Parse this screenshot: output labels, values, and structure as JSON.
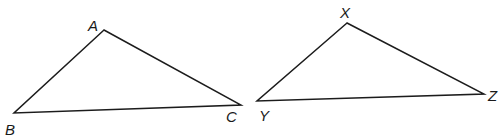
{
  "figure": {
    "background_color": "#ffffff",
    "stroke_color": "#1c1c1c",
    "label_color": "#1a1a1a",
    "stroke_width": 1.5,
    "width": 503,
    "height": 138
  },
  "shapes": [
    {
      "name": "triangle-abc",
      "vertices": [
        {
          "label": "A",
          "x": 104,
          "y": 30,
          "label_x": 88,
          "label_y": 31
        },
        {
          "label": "B",
          "x": 14,
          "y": 113,
          "label_x": 5,
          "label_y": 135
        },
        {
          "label": "C",
          "x": 241,
          "y": 105,
          "label_x": 226,
          "label_y": 122
        }
      ],
      "path": "M 104 30 L 14 113 L 241 105 Z"
    },
    {
      "name": "triangle-xyz",
      "vertices": [
        {
          "label": "X",
          "x": 347,
          "y": 23,
          "label_x": 340,
          "label_y": 18
        },
        {
          "label": "Y",
          "x": 257,
          "y": 101,
          "label_x": 259,
          "label_y": 121
        },
        {
          "label": "Z",
          "x": 484,
          "y": 94,
          "label_x": 488,
          "label_y": 101
        }
      ],
      "path": "M 347 23 L 257 101 L 484 94 Z"
    }
  ],
  "labels": {
    "a": "A",
    "b": "B",
    "c": "C",
    "x": "X",
    "y": "Y",
    "z": "Z"
  }
}
